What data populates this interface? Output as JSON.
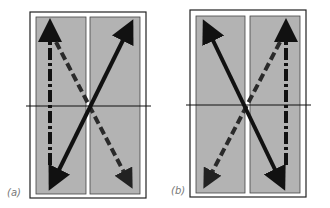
{
  "figure": {
    "panels": [
      {
        "id": "a",
        "label": "(a)",
        "frame": {
          "x": 30,
          "y": 12,
          "w": 116,
          "h": 186
        },
        "panes": [
          {
            "x": 36,
            "y": 17,
            "w": 50,
            "h": 177
          },
          {
            "x": 90,
            "y": 17,
            "w": 50,
            "h": 177
          }
        ],
        "horizon_y": 106,
        "solid_arrow": {
          "from": [
            50,
            188
          ],
          "to": [
            132,
            21
          ],
          "double_headed": true
        },
        "dashed_arrow": {
          "vertical": {
            "x": 50,
            "from_y": 21,
            "to_y": 165
          },
          "diagonal": {
            "from": [
              56,
              42
            ],
            "to": [
              132,
              188
            ]
          }
        }
      },
      {
        "id": "b",
        "label": "(b)",
        "frame": {
          "x": 190,
          "y": 10,
          "w": 116,
          "h": 187
        },
        "panes": [
          {
            "x": 196,
            "y": 16,
            "w": 49,
            "h": 177
          },
          {
            "x": 250,
            "y": 16,
            "w": 50,
            "h": 177
          }
        ],
        "horizon_y": 105,
        "solid_arrow": {
          "from": [
            204,
            22
          ],
          "to": [
            284,
            188
          ],
          "double_headed": true
        },
        "dashed_arrow": {
          "vertical": {
            "x": 286,
            "from_y": 20,
            "to_y": 165
          },
          "diagonal": {
            "from": [
              280,
              42
            ],
            "to": [
              204,
              188
            ]
          }
        }
      }
    ],
    "colors": {
      "pane_fill": "#b3b3b3",
      "frame": "#222222",
      "arrow": "#111111",
      "dashed_arrow": "#2a2a2a",
      "label": "#777777"
    }
  }
}
